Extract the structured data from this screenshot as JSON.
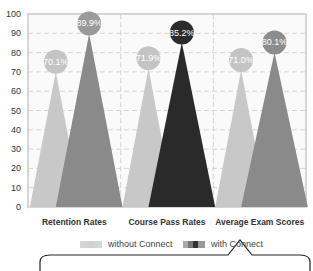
{
  "chart_data": {
    "type": "bar",
    "title": "",
    "xlabel": "",
    "ylabel": "",
    "ylim": [
      0,
      100
    ],
    "yticks": [
      0,
      10,
      20,
      30,
      40,
      50,
      60,
      70,
      80,
      90,
      100
    ],
    "grid": true,
    "categories": [
      "Retention Rates",
      "Course Pass Rates",
      "Average Exam Scores"
    ],
    "series": [
      {
        "name": "without Connect",
        "values": [
          70.1,
          71.9,
          71.0
        ],
        "labels": [
          "70.1%",
          "71.9%",
          "71.0%"
        ]
      },
      {
        "name": "with Connect",
        "values": [
          89.9,
          85.2,
          80.1
        ],
        "labels": [
          "89.9%",
          "85.2%",
          "80.1%"
        ]
      }
    ],
    "colors": {
      "without": "#c8c8c8",
      "with": [
        "#8a8a8a",
        "#2a2a2a",
        "#8a8a8a"
      ],
      "bubble_without": "#c4c4c4",
      "bubble_with": [
        "#9a9a9a",
        "#2b2b2b",
        "#8c8c8c"
      ]
    },
    "legend_position": "bottom"
  },
  "legend": {
    "without_label": "without Connect",
    "with_label": "with Connect"
  }
}
